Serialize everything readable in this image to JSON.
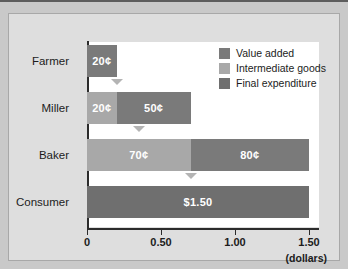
{
  "chart_data": {
    "type": "bar",
    "orientation": "horizontal",
    "stacked": true,
    "title": "",
    "xlabel": "(dollars)",
    "ylabel": "",
    "xlim": [
      0,
      1.5
    ],
    "grid": false,
    "legend_position": "top-right",
    "categories": [
      "Farmer",
      "Miller",
      "Baker",
      "Consumer"
    ],
    "xticks": [
      0,
      0.5,
      1.0,
      1.5
    ],
    "xtick_labels": [
      "0",
      "0.50",
      "1.00",
      "1.50"
    ],
    "legend": [
      {
        "label": "Value added",
        "color": "#7a7a7a"
      },
      {
        "label": "Intermediate goods",
        "color": "#a8a8a8"
      },
      {
        "label": "Final expenditure",
        "color": "#6f6f6f"
      }
    ],
    "series": [
      {
        "name": "Intermediate goods",
        "values": [
          0,
          0.2,
          0.7,
          0
        ]
      },
      {
        "name": "Value added",
        "values": [
          0.2,
          0.5,
          0.8,
          0
        ]
      },
      {
        "name": "Final expenditure",
        "values": [
          0,
          0,
          0,
          1.5
        ]
      }
    ],
    "bars": [
      {
        "category": "Farmer",
        "segments": [
          {
            "type": "value-added",
            "start": 0,
            "end": 0.2,
            "label": "20¢",
            "color": "#7a7a7a"
          }
        ],
        "marker_at": 0.2
      },
      {
        "category": "Miller",
        "segments": [
          {
            "type": "intermediate-goods",
            "start": 0,
            "end": 0.2,
            "label": "20¢",
            "color": "#a8a8a8"
          },
          {
            "type": "value-added",
            "start": 0.2,
            "end": 0.7,
            "label": "50¢",
            "color": "#7a7a7a"
          }
        ],
        "marker_at": 0.35
      },
      {
        "category": "Baker",
        "segments": [
          {
            "type": "intermediate-goods",
            "start": 0,
            "end": 0.7,
            "label": "70¢",
            "color": "#a8a8a8"
          },
          {
            "type": "value-added",
            "start": 0.7,
            "end": 1.5,
            "label": "80¢",
            "color": "#7a7a7a"
          }
        ],
        "marker_at": 0.7
      },
      {
        "category": "Consumer",
        "segments": [
          {
            "type": "final-expenditure",
            "start": 0,
            "end": 1.5,
            "label": "$1.50",
            "color": "#6f6f6f"
          }
        ],
        "marker_at": null
      }
    ]
  },
  "axis": {
    "unit_label": "(dollars)"
  }
}
